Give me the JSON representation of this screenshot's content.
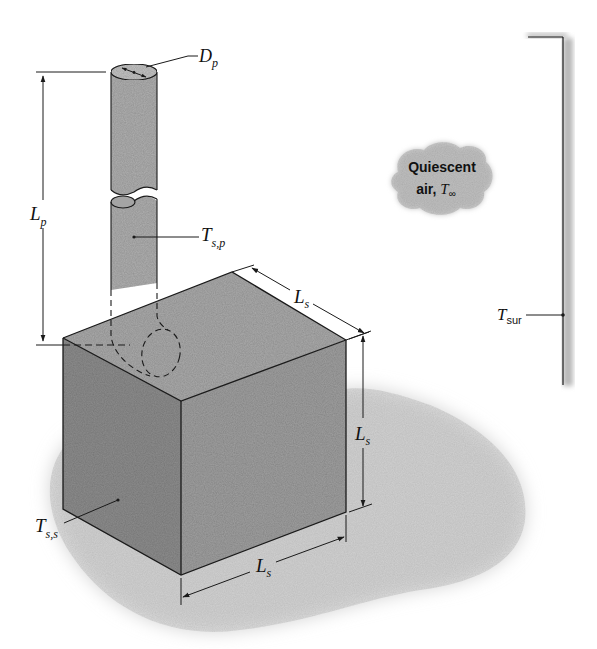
{
  "figure": {
    "type": "heat-transfer-schematic",
    "colors": {
      "line": "#1a1a1a",
      "cube_top": "#ababab",
      "cube_left": "#8e8e8e",
      "cube_right": "#a0a0a0",
      "pipe": "#b0b0b0",
      "shadow": "#d6d6d6",
      "cloud": "#c4c4c4",
      "wall_shade": "#b8b8b8"
    }
  },
  "labels": {
    "pipe_diameter": {
      "main": "D",
      "sub": "p"
    },
    "pipe_length": {
      "main": "L",
      "sub": "p"
    },
    "pipe_surface_temp": {
      "main": "T",
      "sub": "s,p"
    },
    "cube_side_top": {
      "main": "L",
      "sub": "s"
    },
    "cube_side_vertical": {
      "main": "L",
      "sub": "s"
    },
    "cube_side_bottom": {
      "main": "L",
      "sub": "s"
    },
    "cube_surface_temp": {
      "main": "T",
      "sub": "s,s"
    },
    "surroundings_temp": {
      "main": "T",
      "sub": "sur"
    },
    "ambient": {
      "line1": "Quiescent",
      "line2_prefix": "air, ",
      "symbol": "T",
      "sub": "∞"
    }
  }
}
